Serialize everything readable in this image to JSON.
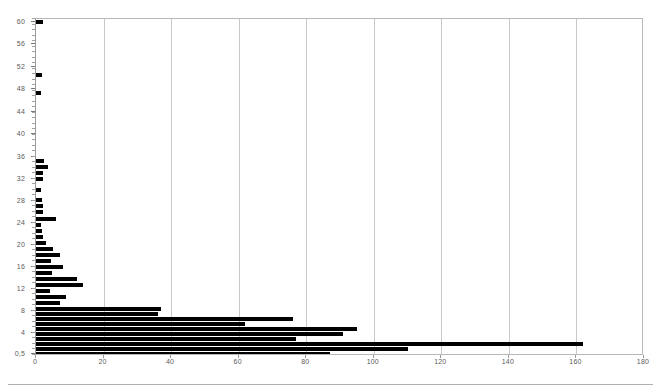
{
  "chart_data": {
    "type": "bar",
    "orientation": "horizontal",
    "title": "",
    "subtitle": "",
    "xlabel": "",
    "ylabel": "",
    "grid": true,
    "legend": null,
    "xlim": [
      0,
      180
    ],
    "xticks": [
      0,
      20,
      40,
      60,
      80,
      100,
      120,
      140,
      160,
      180
    ],
    "xtick_labels": [
      "0",
      "20",
      "40",
      "60",
      "80",
      "100",
      "120",
      "140",
      "160",
      "180"
    ],
    "ytick_labels": [
      "60",
      "56",
      "52",
      "48",
      "44",
      "40",
      "36",
      "32",
      "28",
      "24",
      "20",
      "16",
      "12",
      "8",
      "4",
      "0,5"
    ],
    "ylim_top_label": "60",
    "ylim_bottom_label": "0,5",
    "bar_color": "#000000",
    "categories": [
      "61",
      "60",
      "59",
      "58",
      "57",
      "56",
      "55",
      "54",
      "53",
      "52",
      "51",
      "50",
      "49",
      "48",
      "47",
      "46",
      "45",
      "44",
      "43",
      "42",
      "41",
      "40",
      "39",
      "38",
      "37",
      "36",
      "35",
      "34",
      "33",
      "32",
      "31",
      "30",
      "29",
      "28",
      "27",
      "26",
      "25",
      "24",
      "23",
      "22",
      "21",
      "20",
      "19",
      "18",
      "17",
      "16",
      "15",
      "14",
      "13",
      "12",
      "11",
      "10",
      "9",
      "8",
      "7",
      "6",
      "5",
      "4",
      "3",
      "2",
      "1",
      "0,5"
    ],
    "values": [
      2.0,
      0,
      0,
      0,
      0,
      0,
      0,
      0,
      0,
      1.8,
      0,
      1.6,
      0,
      0,
      0,
      0,
      0,
      0,
      0,
      0,
      0,
      0,
      0,
      0,
      2.4,
      3.6,
      2.0,
      2.2,
      0,
      1.6,
      0,
      1.8,
      2.0,
      6.0,
      1.6,
      1.8,
      2.2,
      3.0,
      5.0,
      7.0,
      4.4,
      8.0,
      4.6,
      12.0,
      14.0,
      4.0,
      9.0,
      7.0,
      37.0,
      36.0,
      76.0,
      62.0,
      95.0,
      91.0,
      77.0,
      162.0,
      110.0,
      87.0,
      0,
      0,
      0,
      0
    ]
  },
  "bars": [
    {
      "label": "60",
      "value": 2.0,
      "y": 21
    },
    {
      "label": "51,5",
      "value": 1.8,
      "y": 74
    },
    {
      "label": "48",
      "value": 1.6,
      "y": 92
    },
    {
      "label": "35",
      "value": 2.4,
      "y": 160
    },
    {
      "label": "34",
      "value": 3.6,
      "y": 166
    },
    {
      "label": "33",
      "value": 2.0,
      "y": 172
    },
    {
      "label": "32",
      "value": 2.2,
      "y": 178
    },
    {
      "label": "30",
      "value": 1.6,
      "y": 189
    },
    {
      "label": "28",
      "value": 1.8,
      "y": 199
    },
    {
      "label": "27",
      "value": 2.0,
      "y": 205
    },
    {
      "label": "26",
      "value": 2.2,
      "y": 211
    },
    {
      "label": "24",
      "value": 6.0,
      "y": 218
    },
    {
      "label": "23",
      "value": 1.6,
      "y": 224
    },
    {
      "label": "22",
      "value": 1.8,
      "y": 230
    },
    {
      "label": "21",
      "value": 2.2,
      "y": 236
    },
    {
      "label": "20",
      "value": 3.0,
      "y": 242
    },
    {
      "label": "19",
      "value": 5.0,
      "y": 248
    },
    {
      "label": "18",
      "value": 7.0,
      "y": 254
    },
    {
      "label": "17,5",
      "value": 4.4,
      "y": 260
    },
    {
      "label": "17",
      "value": 8.0,
      "y": 266
    },
    {
      "label": "16,5",
      "value": 4.6,
      "y": 272
    },
    {
      "label": "16",
      "value": 12.0,
      "y": 278
    },
    {
      "label": "15",
      "value": 14.0,
      "y": 284
    },
    {
      "label": "14",
      "value": 4.0,
      "y": 290
    },
    {
      "label": "13,5",
      "value": 9.0,
      "y": 296
    },
    {
      "label": "13",
      "value": 7.0,
      "y": 302
    },
    {
      "label": "12",
      "value": 37.0,
      "y": 308
    },
    {
      "label": "11",
      "value": 36.0,
      "y": 313
    },
    {
      "label": "10",
      "value": 76.0,
      "y": 318
    },
    {
      "label": "9",
      "value": 62.0,
      "y": 323
    },
    {
      "label": "8",
      "value": 95.0,
      "y": 328
    },
    {
      "label": "6",
      "value": 91.0,
      "y": 333
    },
    {
      "label": "5",
      "value": 77.0,
      "y": 338
    },
    {
      "label": "4",
      "value": 162.0,
      "y": 343
    },
    {
      "label": "2",
      "value": 110.0,
      "y": 348
    },
    {
      "label": "0,5",
      "value": 87.0,
      "y": 353
    }
  ],
  "axes": {
    "x_min": 0,
    "x_max": 180,
    "x_ticks": [
      0,
      20,
      40,
      60,
      80,
      100,
      120,
      140,
      160,
      180
    ],
    "y_ticks": [
      {
        "label": "60",
        "y": 21
      },
      {
        "label": "56",
        "y": 43
      },
      {
        "label": "52",
        "y": 66
      },
      {
        "label": "48",
        "y": 88
      },
      {
        "label": "44",
        "y": 111
      },
      {
        "label": "40",
        "y": 133
      },
      {
        "label": "36",
        "y": 156
      },
      {
        "label": "32",
        "y": 178
      },
      {
        "label": "28",
        "y": 200
      },
      {
        "label": "24",
        "y": 222
      },
      {
        "label": "20",
        "y": 244
      },
      {
        "label": "16",
        "y": 266
      },
      {
        "label": "12",
        "y": 288
      },
      {
        "label": "8",
        "y": 310
      },
      {
        "label": "4",
        "y": 332
      },
      {
        "label": "0,5",
        "y": 353
      }
    ]
  }
}
